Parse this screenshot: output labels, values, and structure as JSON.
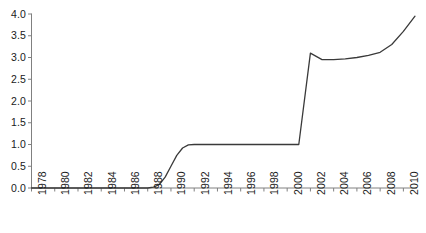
{
  "chart_data": {
    "type": "line",
    "title": "",
    "subtitle": "",
    "xlabel": "",
    "ylabel": "",
    "xlim": [
      1978,
      2011
    ],
    "ylim": [
      0.0,
      4.0
    ],
    "grid": false,
    "legend": null,
    "legend_position": "none",
    "line_color": "#3a3a3a",
    "axis_color": "#808080",
    "text_color": "#1a1a1a",
    "background_color": "#ffffff",
    "x_tick_labels": [
      "1978",
      "1980",
      "1982",
      "1984",
      "1986",
      "1988",
      "1990",
      "1992",
      "1994",
      "1996",
      "1998",
      "2000",
      "2002",
      "2004",
      "2006",
      "2008",
      "2010"
    ],
    "x_tick_values": [
      1978,
      1980,
      1982,
      1984,
      1986,
      1988,
      1990,
      1992,
      1994,
      1996,
      1998,
      2000,
      2002,
      2004,
      2006,
      2008,
      2010
    ],
    "y_tick_labels": [
      "0.0",
      "0.5",
      "1.0",
      "1.5",
      "2.0",
      "2.5",
      "3.0",
      "3.5",
      "4.0"
    ],
    "y_tick_values": [
      0.0,
      0.5,
      1.0,
      1.5,
      2.0,
      2.5,
      3.0,
      3.5,
      4.0
    ],
    "series": [
      {
        "name": "value",
        "x": [
          1978,
          1979,
          1980,
          1981,
          1982,
          1983,
          1984,
          1985,
          1986,
          1987,
          1988,
          1988.5,
          1989,
          1989.5,
          1990,
          1990.5,
          1991,
          1991.5,
          1992,
          1993,
          1994,
          1995,
          1996,
          1997,
          1998,
          1999,
          2000,
          2001,
          2002,
          2003,
          2004,
          2005,
          2006,
          2007,
          2008,
          2009,
          2010,
          2011
        ],
        "values": [
          0.0,
          0.0,
          0.0,
          0.0,
          0.0,
          0.0,
          0.0,
          0.0,
          0.0,
          0.0,
          0.0,
          0.02,
          0.08,
          0.25,
          0.5,
          0.75,
          0.92,
          0.99,
          1.0,
          1.0,
          1.0,
          1.0,
          1.0,
          1.0,
          1.0,
          1.0,
          1.0,
          1.0,
          3.1,
          2.95,
          2.95,
          2.97,
          3.0,
          3.05,
          3.12,
          3.3,
          3.6,
          3.95
        ]
      }
    ],
    "annotations": []
  }
}
